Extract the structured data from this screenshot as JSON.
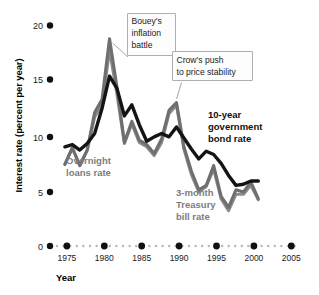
{
  "chart_data": {
    "type": "line",
    "title": "",
    "xlabel": "Year",
    "ylabel": "Interest rate (percent per year)",
    "xlim": [
      1973,
      2006
    ],
    "ylim": [
      0,
      20
    ],
    "grid": false,
    "legend_position": "inline-annotations",
    "y_ticks": [
      0,
      5,
      10,
      15,
      20
    ],
    "y_tick_labels": [
      "0",
      "5",
      "10",
      "15",
      "20"
    ],
    "x_ticks": [
      1975,
      1980,
      1985,
      1990,
      1995,
      2000,
      2005
    ],
    "x_tick_labels": [
      "1975",
      "1980",
      "1985",
      "1990",
      "1995",
      "2000",
      "2005"
    ],
    "colors": {
      "bond": "#141414",
      "overnight": "#6f6f6f",
      "tbill": "#8c8c8c",
      "axis": "#111111",
      "callout_border": "#9a9a9a"
    },
    "x": [
      1975,
      1976,
      1977,
      1978,
      1979,
      1980,
      1981,
      1982,
      1983,
      1984,
      1985,
      1986,
      1987,
      1988,
      1989,
      1990,
      1991,
      1992,
      1993,
      1994,
      1995,
      1996,
      1997,
      1998,
      1999,
      2000,
      2001
    ],
    "series": [
      {
        "name": "10-year government bond rate",
        "color": "#141414",
        "values": [
          9.0,
          9.2,
          8.7,
          9.3,
          10.2,
          12.5,
          15.4,
          14.3,
          11.8,
          12.8,
          11.0,
          9.5,
          9.9,
          10.2,
          9.9,
          10.8,
          9.8,
          8.8,
          7.9,
          8.6,
          8.3,
          7.5,
          6.4,
          5.5,
          5.6,
          5.9,
          5.9
        ]
      },
      {
        "name": "Overnight loans rate",
        "color": "#6f6f6f",
        "values": [
          7.4,
          8.9,
          7.3,
          8.7,
          12.1,
          13.3,
          18.8,
          14.4,
          9.4,
          11.3,
          9.6,
          9.2,
          8.4,
          9.7,
          12.3,
          13.0,
          9.0,
          6.8,
          5.1,
          5.5,
          7.3,
          4.5,
          3.5,
          5.1,
          4.9,
          5.8,
          4.3
        ]
      },
      {
        "name": "3-month Treasury bill rate",
        "color": "#8c8c8c",
        "values": [
          7.4,
          8.9,
          7.3,
          8.7,
          11.7,
          12.8,
          17.8,
          13.8,
          9.3,
          11.1,
          9.4,
          9.0,
          8.2,
          9.4,
          12.0,
          12.8,
          8.8,
          6.5,
          4.9,
          5.4,
          7.0,
          4.3,
          3.2,
          4.7,
          4.7,
          5.5,
          4.2
        ]
      }
    ],
    "annotations": [
      {
        "id": "bouey",
        "line1": "Bouey's",
        "line2": "inflation",
        "line3": "battle",
        "target_year": 1981,
        "target_value": 18.8
      },
      {
        "id": "crow",
        "line1": "Crow's push",
        "line2": "to price stability",
        "target_year": 1990,
        "target_value": 13.0
      }
    ],
    "series_labels": [
      {
        "id": "overnight",
        "line1": "Overnight",
        "line2": "loans rate",
        "line3": "",
        "color": "gray"
      },
      {
        "id": "bond",
        "line1": "10-year",
        "line2": "government",
        "line3": "bond rate",
        "color": "black"
      },
      {
        "id": "tbill",
        "line1": "3-month",
        "line2": "Treasury",
        "line3": "bill rate",
        "color": "gray"
      }
    ]
  }
}
